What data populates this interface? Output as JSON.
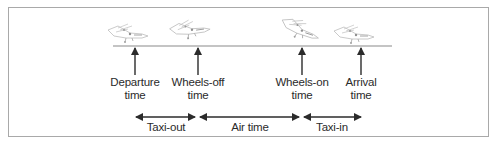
{
  "diagram": {
    "events": [
      {
        "id": "departure",
        "line1": "Departure",
        "line2": "time",
        "x": 135
      },
      {
        "id": "wheels-off",
        "line1": "Wheels-off",
        "line2": "time",
        "x": 198
      },
      {
        "id": "wheels-on",
        "line1": "Wheels-on",
        "line2": "time",
        "x": 302
      },
      {
        "id": "arrival",
        "line1": "Arrival",
        "line2": "time",
        "x": 361
      }
    ],
    "intervals": [
      {
        "id": "taxi-out",
        "label": "Taxi-out",
        "from": "departure",
        "to": "wheels-off"
      },
      {
        "id": "air-time",
        "label": "Air time",
        "from": "wheels-off",
        "to": "wheels-on"
      },
      {
        "id": "taxi-in",
        "label": "Taxi-in",
        "from": "wheels-on",
        "to": "arrival"
      }
    ],
    "colors": {
      "border": "#a9a9a9",
      "runway": "#8a8a8a",
      "arrow": "#2b2b2b",
      "text": "#2b2b2b",
      "airplane": "#b8b8b8"
    }
  }
}
